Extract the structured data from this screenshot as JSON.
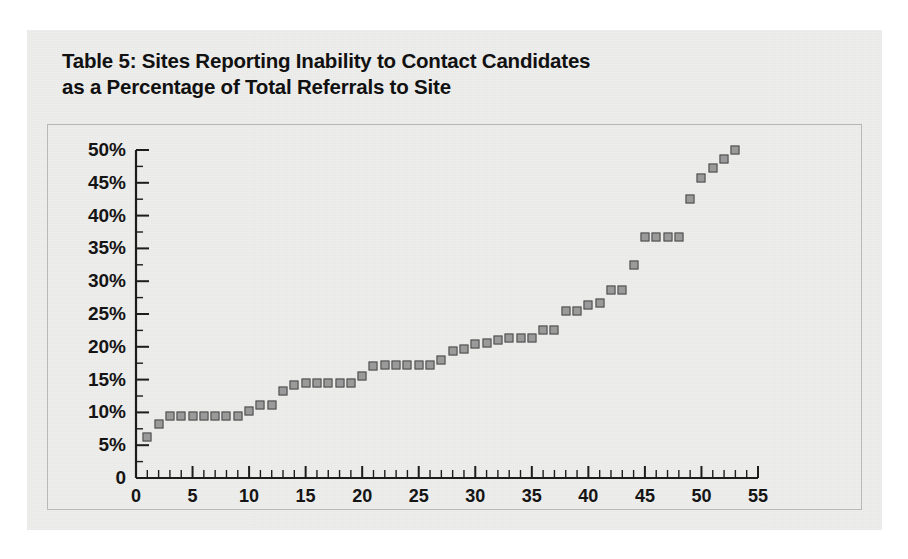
{
  "page": {
    "background_color": "#ffffff",
    "panel_color": "#eeeeec",
    "frame_color": "#b8b8b4"
  },
  "title": {
    "line1": "Table 5: Sites Reporting Inability to Contact Candidates",
    "line2": "as a Percentage of Total Referrals to Site",
    "full": "Table 5: Sites Reporting Inability to Contact Candidates\nas a Percentage of Total Referrals to Site"
  },
  "chart_data": {
    "type": "scatter",
    "title": "Table 5: Sites Reporting Inability to Contact Candidates as a Percentage of Total Referrals to Site",
    "xlabel": "",
    "ylabel": "",
    "xlim": [
      0,
      55
    ],
    "ylim": [
      0,
      50
    ],
    "x_ticks": [
      0,
      5,
      10,
      15,
      20,
      25,
      30,
      35,
      40,
      45,
      50,
      55
    ],
    "x_tick_labels": [
      "0",
      "5",
      "10",
      "15",
      "20",
      "25",
      "30",
      "35",
      "40",
      "45",
      "50",
      "55"
    ],
    "x_minor_tick_step": 1,
    "y_ticks": [
      0,
      5,
      10,
      15,
      20,
      25,
      30,
      35,
      40,
      45,
      50
    ],
    "y_tick_labels": [
      "0",
      "5%",
      "10%",
      "15%",
      "20%",
      "25%",
      "30%",
      "35%",
      "40%",
      "45%",
      "50%"
    ],
    "grid": false,
    "legend": false,
    "marker": {
      "shape": "square",
      "fill_color": "#9a9a9a",
      "edge_color": "#4a4a4a",
      "size_px": 9
    },
    "point_count": 53,
    "x": [
      1,
      2,
      3,
      4,
      5,
      6,
      7,
      8,
      9,
      10,
      11,
      12,
      13,
      14,
      15,
      16,
      17,
      18,
      19,
      20,
      21,
      22,
      23,
      24,
      25,
      26,
      27,
      28,
      29,
      30,
      31,
      32,
      33,
      34,
      35,
      36,
      37,
      38,
      39,
      40,
      41,
      42,
      43,
      44,
      45,
      46,
      47,
      48,
      49,
      50,
      51,
      52,
      53
    ],
    "y": [
      6.3,
      8.3,
      9.5,
      9.5,
      9.5,
      9.5,
      9.5,
      9.5,
      9.5,
      10.2,
      11.2,
      11.2,
      13.3,
      14.2,
      14.5,
      14.5,
      14.5,
      14.5,
      14.5,
      15.5,
      17.0,
      17.2,
      17.2,
      17.2,
      17.2,
      17.3,
      18.0,
      19.3,
      19.7,
      20.5,
      20.6,
      21.1,
      21.3,
      21.3,
      21.4,
      22.5,
      22.6,
      25.4,
      25.5,
      26.4,
      26.7,
      28.6,
      28.7,
      32.5,
      36.7,
      36.7,
      36.7,
      36.7,
      42.5,
      45.7,
      47.2,
      48.6,
      50.0
    ]
  }
}
